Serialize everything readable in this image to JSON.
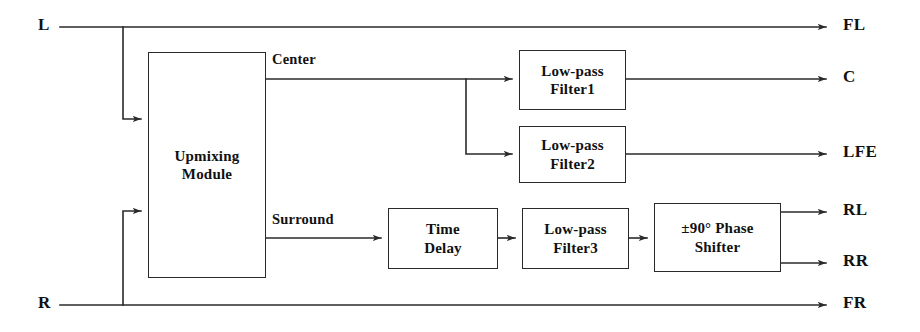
{
  "diagram": {
    "line_color": "#2a2a2a",
    "text_color": "#111111",
    "background": "#ffffff",
    "inputs": [
      {
        "id": "in-l",
        "label": "L",
        "x": 40,
        "y": 27
      },
      {
        "id": "in-r",
        "label": "R",
        "x": 40,
        "y": 305
      }
    ],
    "outputs": [
      {
        "id": "out-fl",
        "label": "FL",
        "x": 845,
        "y": 27
      },
      {
        "id": "out-c",
        "label": "C",
        "x": 845,
        "y": 79
      },
      {
        "id": "out-lfe",
        "label": "LFE",
        "x": 845,
        "y": 154
      },
      {
        "id": "out-rl",
        "label": "RL",
        "x": 845,
        "y": 212
      },
      {
        "id": "out-rr",
        "label": "RR",
        "x": 845,
        "y": 263
      },
      {
        "id": "out-fr",
        "label": "FR",
        "x": 845,
        "y": 305
      }
    ],
    "blocks": [
      {
        "id": "upmixing-module",
        "lines": [
          "Upmixing",
          "Module"
        ],
        "x": 148,
        "y": 52,
        "w": 118,
        "h": 226
      },
      {
        "id": "low-pass-filter-1",
        "lines": [
          "Low-pass",
          "Filter1"
        ],
        "x": 519,
        "y": 50,
        "w": 107,
        "h": 60
      },
      {
        "id": "low-pass-filter-2",
        "lines": [
          "Low-pass",
          "Filter2"
        ],
        "x": 519,
        "y": 126,
        "w": 107,
        "h": 57
      },
      {
        "id": "time-delay",
        "lines": [
          "Time",
          "Delay"
        ],
        "x": 388,
        "y": 208,
        "w": 110,
        "h": 61
      },
      {
        "id": "low-pass-filter-3",
        "lines": [
          "Low-pass",
          "Filter3"
        ],
        "x": 522,
        "y": 208,
        "w": 107,
        "h": 61
      },
      {
        "id": "phase-shifter",
        "lines": [
          "±90° Phase",
          "Shifter"
        ],
        "x": 654,
        "y": 203,
        "w": 127,
        "h": 69
      }
    ],
    "signal_labels": [
      {
        "id": "center-label",
        "label": "Center",
        "x": 272,
        "y": 51
      },
      {
        "id": "surround-label",
        "label": "Surround",
        "x": 272,
        "y": 204
      }
    ]
  }
}
